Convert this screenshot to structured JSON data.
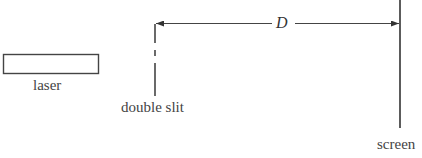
{
  "diagram": {
    "components": {
      "laser": {
        "label": "laser"
      },
      "double_slit": {
        "label": "double slit"
      },
      "screen": {
        "label": "screen"
      }
    },
    "dimension": {
      "label": "D",
      "from": "double slit",
      "to": "screen"
    },
    "colors": {
      "line": "#333333",
      "background": "#ffffff"
    }
  }
}
